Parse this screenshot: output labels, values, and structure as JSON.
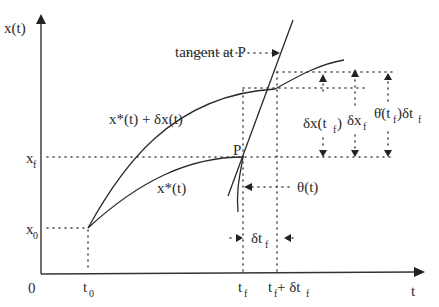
{
  "diagram": {
    "axes": {
      "y_label": "x(t)",
      "x_label": "t",
      "origin_label": "0"
    },
    "ticks": {
      "x": [
        {
          "id": "t0",
          "base": "t",
          "sub": "0"
        },
        {
          "id": "tf",
          "base": "t",
          "sub": "f"
        },
        {
          "id": "tf_plus",
          "base": "t",
          "sub": "f",
          "suffix": " + δt",
          "suffix_sub": "f"
        }
      ],
      "y": [
        {
          "id": "x0",
          "base": "x",
          "sub": "0"
        },
        {
          "id": "xf",
          "base": "x",
          "sub": "f"
        }
      ]
    },
    "labels": {
      "tangent": "tangent at P",
      "perturbed_curve": "x*(t) + δx(t)",
      "optimal_curve": "x*(t)",
      "point": "P",
      "theta": "θ(t)",
      "delta_x_tf": {
        "base": "δx(t",
        "sub": "f",
        "tail": ")"
      },
      "delta_xf": {
        "base": "δx",
        "sub": "f"
      },
      "theta_dot": {
        "base": "θ̇(t",
        "sub": "f",
        "mid": ")δt",
        "sub2": "f"
      },
      "delta_tf": {
        "base": "δt",
        "sub": "f"
      }
    }
  }
}
